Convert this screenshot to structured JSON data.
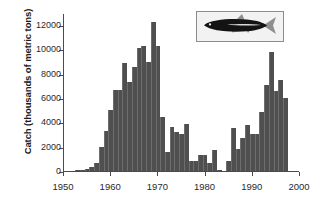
{
  "chart_data": {
    "type": "bar",
    "title": "",
    "subtitle": "",
    "xlabel": "",
    "ylabel": "Catch (thousands of metric tons)",
    "xlim": [
      1950,
      2000
    ],
    "ylim": [
      0,
      13000
    ],
    "grid": false,
    "legend": null,
    "bar_color": "#4f4f4f",
    "axis_color": "#4b4b4b",
    "xticks": [
      1950,
      1960,
      1970,
      1980,
      1990,
      2000
    ],
    "xtick_labels": [
      "1950",
      "1960",
      "1970",
      "1980",
      "1990",
      "2000"
    ],
    "yticks": [
      0,
      2000,
      4000,
      6000,
      8000,
      10000,
      12000
    ],
    "ytick_labels": [
      "0",
      "2000",
      "4000",
      "6000",
      "8000",
      "10000",
      "12000"
    ],
    "x": [
      1953,
      1954,
      1955,
      1956,
      1957,
      1958,
      1959,
      1960,
      1961,
      1962,
      1963,
      1964,
      1965,
      1966,
      1967,
      1968,
      1969,
      1970,
      1971,
      1972,
      1973,
      1974,
      1975,
      1976,
      1977,
      1978,
      1979,
      1980,
      1981,
      1982,
      1983,
      1985,
      1986,
      1987,
      1988,
      1989,
      1990,
      1991,
      1992,
      1993,
      1994,
      1995,
      1996,
      1997
    ],
    "values": [
      30,
      40,
      180,
      360,
      620,
      2000,
      3300,
      4980,
      6650,
      6630,
      8880,
      7300,
      8550,
      10120,
      10280,
      8970,
      12300,
      10250,
      4430,
      1560,
      3650,
      3220,
      3060,
      3900,
      790,
      810,
      1330,
      1290,
      620,
      1760,
      110,
      830,
      3550,
      1820,
      2710,
      3780,
      3040,
      3080,
      4880,
      7070,
      9830,
      6600,
      7480,
      6000
    ],
    "series_name": "Peruvian anchoveta catch"
  },
  "inset": {
    "icon_name": "fish-illustration",
    "description": "Anchoveta fish illustration"
  }
}
